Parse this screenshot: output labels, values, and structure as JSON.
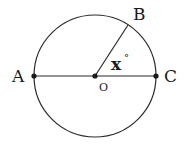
{
  "diagram": {
    "type": "geometry-circle",
    "stroke_color": "#2b2b2b",
    "point_color": "#1a1a1a",
    "circle": {
      "cx": 95,
      "cy": 76,
      "r": 61
    },
    "points": {
      "A": {
        "label": "A",
        "x": 34,
        "y": 76
      },
      "O": {
        "label": "O",
        "x": 95,
        "y": 76
      },
      "C": {
        "label": "C",
        "x": 156,
        "y": 76
      },
      "B": {
        "label": "B",
        "x": 128,
        "y": 25
      }
    },
    "segments": [
      {
        "from": "A",
        "to": "C",
        "name": "diameter AC"
      },
      {
        "from": "O",
        "to": "B",
        "name": "radius OB"
      }
    ],
    "angle": {
      "label": "x",
      "unit": "°",
      "vertex": "O",
      "between": [
        "B",
        "C"
      ]
    }
  }
}
